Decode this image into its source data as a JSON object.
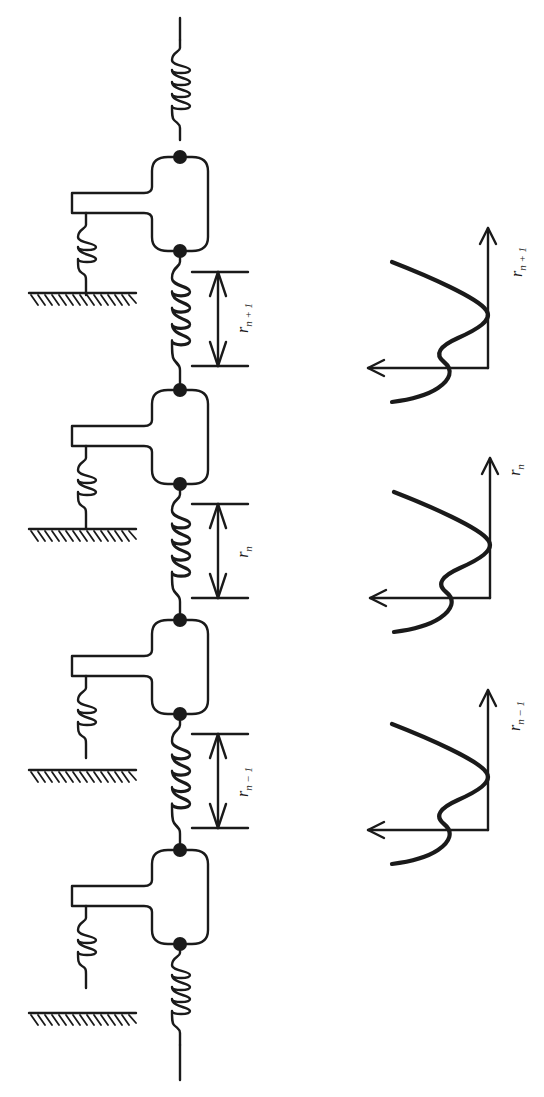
{
  "figure": {
    "orientation": "rotated 90 degrees (chain runs top to bottom)",
    "ink_color": "#1a1a1a",
    "background_color": "#ffffff"
  },
  "chain": {
    "masses": [
      {
        "id": "mass-1",
        "index": 1
      },
      {
        "id": "mass-2",
        "index": 2
      },
      {
        "id": "mass-3",
        "index": 3
      },
      {
        "id": "mass-4",
        "index": 4
      }
    ],
    "bond_labels": [
      {
        "id": "bond-n-plus-1",
        "text": "r",
        "subscript": "n + 1"
      },
      {
        "id": "bond-n",
        "text": "r",
        "subscript": "n"
      },
      {
        "id": "bond-n-minus-1",
        "text": "r",
        "subscript": "n − 1"
      }
    ]
  },
  "potentials": {
    "plots": [
      {
        "id": "potential-n-plus-1",
        "axis_label": "r",
        "axis_subscript": "n + 1"
      },
      {
        "id": "potential-n",
        "axis_label": "r",
        "axis_subscript": "n"
      },
      {
        "id": "potential-n-minus-1",
        "axis_label": "r",
        "axis_subscript": "n − 1"
      }
    ]
  }
}
